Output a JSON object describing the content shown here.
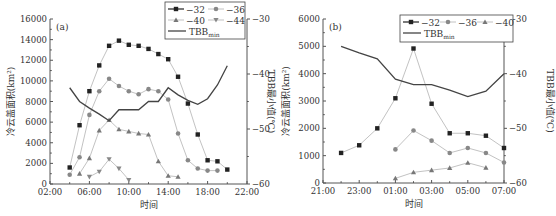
{
  "chart_data": [
    {
      "panel": "(a)",
      "type": "line",
      "title": "",
      "xlabel": "时间",
      "ylabel": "冷云盖面积(km²)",
      "ylabel_right": "TBB最小值(℃)",
      "x_ticks": [
        "02:00",
        "06:00",
        "10:00",
        "14:00",
        "18:00",
        "22:00"
      ],
      "xlim_hours": [
        2,
        22
      ],
      "y_ticks": [
        0,
        2000,
        4000,
        6000,
        8000,
        10000,
        12000,
        14000,
        16000
      ],
      "ylim": [
        0,
        16000
      ],
      "y_right_ticks": [
        -30,
        -40,
        -50,
        -60
      ],
      "ylim_right": [
        -60,
        -30
      ],
      "legend": [
        "-32",
        "-36",
        "-40",
        "-44",
        "TBBmin"
      ],
      "legend_position": "top-right",
      "series": [
        {
          "name": "-32",
          "marker": "square",
          "x": [
            4,
            5,
            6,
            7,
            8,
            9,
            10,
            11,
            12,
            13,
            14,
            15,
            16,
            17,
            18,
            19,
            20
          ],
          "values": [
            1600,
            5700,
            9000,
            11500,
            13400,
            13900,
            13500,
            13400,
            13100,
            12600,
            12100,
            10400,
            7800,
            4800,
            2300,
            2200,
            1400
          ]
        },
        {
          "name": "-36",
          "marker": "circle",
          "x": [
            4,
            5,
            6,
            7,
            8,
            9,
            10,
            11,
            12,
            13,
            14,
            15,
            16,
            17,
            18,
            19
          ],
          "values": [
            900,
            2600,
            6700,
            9000,
            10200,
            9500,
            9000,
            8700,
            9200,
            9000,
            8200,
            4900,
            2300,
            1500,
            1300,
            1300
          ]
        },
        {
          "name": "-40",
          "marker": "triangle-up",
          "x": [
            5,
            6,
            7,
            8,
            9,
            10,
            11,
            12,
            13,
            14,
            15
          ],
          "values": [
            1000,
            2500,
            5200,
            6200,
            5300,
            5100,
            4900,
            4800,
            2200,
            800,
            700
          ]
        },
        {
          "name": "-44",
          "marker": "triangle-down",
          "x": [
            6,
            7,
            8,
            9,
            10
          ],
          "values": [
            700,
            1200,
            2400,
            1500,
            400
          ]
        },
        {
          "name": "TBBmin",
          "marker": "none",
          "axis": "right",
          "x": [
            4,
            5,
            6,
            7,
            8,
            9,
            10,
            11,
            12,
            13,
            14,
            15,
            16,
            17,
            18,
            19,
            20
          ],
          "values": [
            -42.5,
            -45,
            -46.2,
            -47.3,
            -48.5,
            -46.5,
            -46.5,
            -46.5,
            -45,
            -45,
            -42.5,
            -43.8,
            -44.8,
            -45.5,
            -44.5,
            -42,
            -38.5
          ]
        }
      ]
    },
    {
      "panel": "(b)",
      "type": "line",
      "title": "",
      "xlabel": "时间",
      "ylabel": "冷云盖面积(km²)",
      "ylabel_right": "TBB最小值(℃)",
      "x_ticks": [
        "21:00",
        "23:00",
        "01:00",
        "03:00",
        "05:00",
        "07:00"
      ],
      "xlim_hours": [
        21,
        31
      ],
      "y_ticks": [
        0,
        1000,
        2000,
        3000,
        4000,
        5000,
        6000
      ],
      "ylim": [
        0,
        6000
      ],
      "y_right_ticks": [
        -30,
        -40,
        -50,
        -60
      ],
      "ylim_right": [
        -60,
        -30
      ],
      "legend": [
        "-32",
        "-36",
        "-40",
        "TBBmin"
      ],
      "legend_position": "top-right",
      "series": [
        {
          "name": "-32",
          "marker": "square",
          "x": [
            22,
            23,
            24,
            25,
            26,
            27,
            28,
            29,
            30,
            31
          ],
          "values": [
            1100,
            1380,
            2000,
            3100,
            4920,
            2900,
            1820,
            1820,
            1730,
            1280
          ]
        },
        {
          "name": "-36",
          "marker": "circle",
          "x": [
            25,
            26,
            27,
            28,
            29,
            30,
            31
          ],
          "values": [
            1230,
            1920,
            1550,
            1100,
            1280,
            1100,
            750
          ]
        },
        {
          "name": "-40",
          "marker": "triangle-up",
          "x": [
            25,
            26,
            27,
            28,
            29,
            30
          ],
          "values": [
            170,
            390,
            470,
            550,
            740,
            560
          ]
        },
        {
          "name": "TBBmin",
          "marker": "none",
          "axis": "right",
          "x": [
            22,
            23,
            24,
            25,
            26,
            27,
            28,
            29,
            30,
            31
          ],
          "values": [
            -35,
            -36.2,
            -37.3,
            -41,
            -42,
            -42,
            -43,
            -44.2,
            -43.2,
            -40
          ]
        }
      ]
    }
  ],
  "panels": [
    {
      "label": "(a)",
      "xlabel": "时间",
      "ylabel": "冷云盖面积(km²)",
      "ylabel_right": "TBB最小值(℃)"
    },
    {
      "label": "(b)",
      "xlabel": "时间",
      "ylabel": "冷云盖面积(km²)",
      "ylabel_right": "TBB最小值(℃)"
    }
  ],
  "colors": {
    "axis": "#555555",
    "s32": "#222222",
    "s36": "#888888",
    "s40": "#777777",
    "s44": "#888888",
    "line_light": "#bbbbbb",
    "tbb": "#444444"
  }
}
